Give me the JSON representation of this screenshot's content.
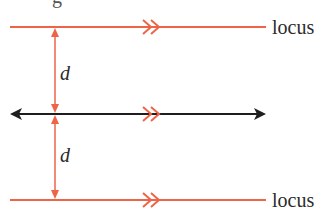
{
  "diagram": {
    "title_fragment": "g",
    "colors": {
      "locus_line": "#ee6447",
      "given_line": "#1e1e1e",
      "distance_arrow": "#ee6447",
      "text": "#2b2b2b"
    },
    "lines": [
      {
        "role": "locus",
        "label": "locus",
        "y": 27,
        "x1": 10,
        "x2": 266,
        "parallel_mark": "double-chevron"
      },
      {
        "role": "given-line",
        "label": "",
        "y": 114,
        "x1": 10,
        "x2": 266,
        "arrows": "both-ends",
        "parallel_mark": "double-chevron"
      },
      {
        "role": "locus",
        "label": "locus",
        "y": 200,
        "x1": 10,
        "x2": 266,
        "parallel_mark": "double-chevron"
      }
    ],
    "distances": [
      {
        "label": "d",
        "from_y": 27,
        "to_y": 114,
        "x": 55
      },
      {
        "label": "d",
        "from_y": 114,
        "to_y": 200,
        "x": 55
      }
    ],
    "labels": {
      "top_locus": "locus",
      "bottom_locus": "locus",
      "top_distance": "d",
      "bottom_distance": "d"
    }
  }
}
